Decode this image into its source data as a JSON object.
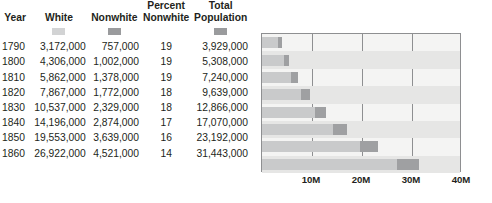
{
  "table": {
    "columns": [
      {
        "key": "year",
        "label": "Year",
        "swatch": null
      },
      {
        "key": "white",
        "label": "White",
        "swatch": "#d2d3d4"
      },
      {
        "key": "nonwhite",
        "label": "Nonwhite",
        "swatch": "#9a9b9d"
      },
      {
        "key": "pct",
        "label": "Percent\nNonwhite",
        "swatch": null
      },
      {
        "key": "total",
        "label": "Total\nPopulation",
        "swatch": "#9a9b9d"
      }
    ],
    "headers": {
      "year": "Year",
      "white": "White",
      "nonwhite": "Nonwhite",
      "percent_nonwhite_line1": "Percent",
      "percent_nonwhite_line2": "Nonwhite",
      "total_population_line1": "Total",
      "total_population_line2": "Population"
    },
    "rows": [
      {
        "year": "1790",
        "white": "3,172,000",
        "nonwhite": "757,000",
        "pct": "19",
        "total": "3,929,000"
      },
      {
        "year": "1800",
        "white": "4,306,000",
        "nonwhite": "1,002,000",
        "pct": "19",
        "total": "5,308,000"
      },
      {
        "year": "1810",
        "white": "5,862,000",
        "nonwhite": "1,378,000",
        "pct": "19",
        "total": "7,240,000"
      },
      {
        "year": "1820",
        "white": "7,867,000",
        "nonwhite": "1,772,000",
        "pct": "18",
        "total": "9,639,000"
      },
      {
        "year": "1830",
        "white": "10,537,000",
        "nonwhite": "2,329,000",
        "pct": "18",
        "total": "12,866,000"
      },
      {
        "year": "1840",
        "white": "14,196,000",
        "nonwhite": "2,874,000",
        "pct": "17",
        "total": "17,070,000"
      },
      {
        "year": "1850",
        "white": "19,553,000",
        "nonwhite": "3,639,000",
        "pct": "16",
        "total": "23,192,000"
      },
      {
        "year": "1860",
        "white": "26,922,000",
        "nonwhite": "4,521,000",
        "pct": "14",
        "total": "31,443,000"
      }
    ]
  },
  "chart_data": {
    "type": "bar",
    "orientation": "horizontal",
    "stacked": true,
    "title": "",
    "xlabel": "",
    "ylabel": "",
    "categories": [
      "1790",
      "1800",
      "1810",
      "1820",
      "1830",
      "1840",
      "1850",
      "1860"
    ],
    "series": [
      {
        "name": "White",
        "color": "#c9cacb",
        "values": [
          3172000,
          4306000,
          5862000,
          7867000,
          10537000,
          14196000,
          19553000,
          26922000
        ]
      },
      {
        "name": "Nonwhite",
        "color": "#9fa0a2",
        "values": [
          757000,
          1002000,
          1378000,
          1772000,
          2329000,
          2874000,
          3639000,
          4521000
        ]
      }
    ],
    "totals": [
      3929000,
      5308000,
      7240000,
      9639000,
      12866000,
      17070000,
      23192000,
      31443000
    ],
    "xlim": [
      0,
      40000000
    ],
    "xticks": [
      10000000,
      20000000,
      30000000,
      40000000
    ],
    "xtick_labels": [
      "10M",
      "20M",
      "30M",
      "40M"
    ],
    "grid": true,
    "legend_position": "table-header-swatches"
  },
  "credit": "© Cengage Learning",
  "colors": {
    "white_segment": "#c9cacb",
    "nonwhite_segment": "#9fa0a2",
    "plot_background": "#f4f4f3",
    "row_shade": "#e6e6e5",
    "axis": "#8e8f91",
    "text": "#231f20"
  }
}
